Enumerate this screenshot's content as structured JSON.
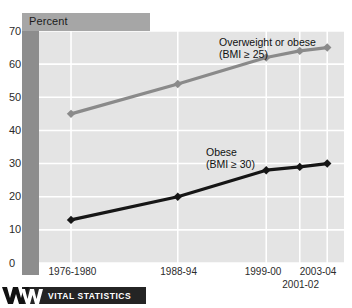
{
  "figure": {
    "axis_title": "Percent",
    "footer_brand": "VITAL STATISTICS",
    "footer_logo_icon": "vital-statistics-w-logo"
  },
  "chart_data": {
    "type": "line",
    "title": "Percent",
    "xlabel": "",
    "ylabel": "Percent",
    "ylim": [
      0,
      70
    ],
    "yticks": [
      0,
      10,
      20,
      30,
      40,
      50,
      60,
      70
    ],
    "grid": true,
    "legend": "inline-annotations",
    "categories": [
      "1976-1980",
      "1988-94",
      "1999-00",
      "2001-02",
      "2003-04"
    ],
    "category_label_rows": {
      "row1": [
        "1976-1980",
        "1988-94",
        "1999-00",
        "2003-04"
      ],
      "row2": [
        "2001-02"
      ]
    },
    "series": [
      {
        "name": "Overweight or obese",
        "annotation_line1": "Overweight or obese",
        "annotation_line2": "(BMI ≥ 25)",
        "color": "#8a8a8a",
        "marker": "diamond",
        "values": [
          45,
          54,
          62,
          64,
          65
        ]
      },
      {
        "name": "Obese",
        "annotation_line1": "Obese",
        "annotation_line2": "(BMI ≥ 30)",
        "color": "#161616",
        "marker": "diamond",
        "values": [
          13,
          20,
          28,
          29,
          30
        ]
      }
    ]
  },
  "colors": {
    "plot_background": "#e4e4e4",
    "gridline": "#ffffff",
    "header_band": "#a6a6a6",
    "left_band": "#8d8d8d",
    "footer_bar": "#242424",
    "series_overweight": "#8a8a8a",
    "series_obese": "#161616"
  }
}
